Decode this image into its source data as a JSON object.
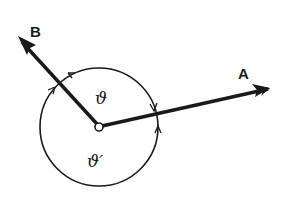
{
  "diagram": {
    "vectors": [
      {
        "name": "A",
        "label": "A"
      },
      {
        "name": "B",
        "label": "B"
      }
    ],
    "angles": [
      {
        "name": "theta",
        "label": "ϑ"
      },
      {
        "name": "theta-prime",
        "label": "ϑ′"
      }
    ],
    "colors": {
      "stroke": "#1a1a1a",
      "background": "#ffffff"
    }
  }
}
